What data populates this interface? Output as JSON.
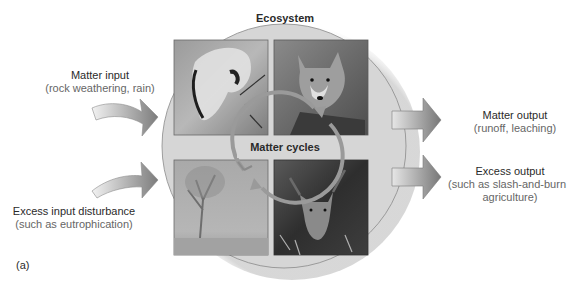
{
  "diagram": {
    "title": "Ecosystem",
    "center_label": "Matter cycles",
    "panel_label": "(a)",
    "inputs": [
      {
        "label": "Matter input",
        "detail": "(rock weathering, rain)"
      },
      {
        "label": "Excess input disturbance",
        "detail": "(such as eutrophication)"
      }
    ],
    "outputs": [
      {
        "label": "Matter output",
        "detail": "(runoff, leaching)"
      },
      {
        "label": "Excess output",
        "detail": "(such as slash-and-burn",
        "detail2": "agriculture)"
      }
    ],
    "photos": [
      {
        "position": "top-left",
        "subject": "animal skull (decomposition)"
      },
      {
        "position": "top-right",
        "subject": "wolf"
      },
      {
        "position": "bottom-left",
        "subject": "misty forest with tree"
      },
      {
        "position": "bottom-right",
        "subject": "deer"
      }
    ],
    "colors": {
      "circle_fill": "#d6d6d6",
      "circle_stroke": "#8a8a8a",
      "arrow_dark": "#7a7a7a",
      "arrow_light": "#e2e2e2",
      "cycle_arrow": "#9a9a9a",
      "text": "#2a2a2a",
      "subtext": "#666666"
    }
  }
}
